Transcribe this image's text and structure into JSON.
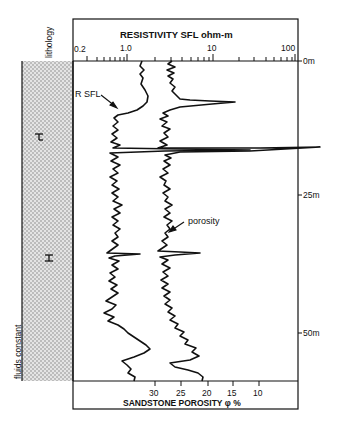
{
  "labels": {
    "lithology": "lithology",
    "fluids": "fluids constant",
    "resistivity_title": "RESISTIVITY SFL ohm-m",
    "porosity_title": "SANDSTONE POROSITY φ  %",
    "r_sfl_annotation": "R SFL",
    "porosity_annotation": "porosity"
  },
  "resistivity_axis": {
    "scale": "log",
    "ticks": [
      {
        "value": 0.2,
        "label": "0.2"
      },
      {
        "value": 1.0,
        "label": "1.0"
      },
      {
        "value": 10,
        "label": "10"
      },
      {
        "value": 100,
        "label": "100"
      }
    ]
  },
  "porosity_axis": {
    "ticks": [
      {
        "value": 30,
        "label": "30"
      },
      {
        "value": 25,
        "label": "25"
      },
      {
        "value": 20,
        "label": "20"
      },
      {
        "value": 15,
        "label": "15"
      },
      {
        "value": 10,
        "label": "10"
      }
    ]
  },
  "depth_axis": {
    "ticks": [
      {
        "value": 0,
        "label": "0m"
      },
      {
        "value": 25,
        "label": "25m"
      },
      {
        "value": 50,
        "label": "50m"
      }
    ]
  },
  "lithology": {
    "pattern": "sandstone (dotted)",
    "symbols": [
      "H",
      "H"
    ]
  },
  "colors": {
    "ink": "#111111",
    "sand_fill": "#d9d9d9"
  }
}
